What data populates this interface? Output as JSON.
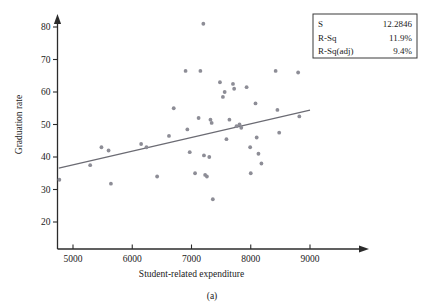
{
  "figure": {
    "caption": "(a)"
  },
  "stats_box": {
    "rows": [
      {
        "label": "S",
        "value": "12.2846"
      },
      {
        "label": "R-Sq",
        "value": "11.9%"
      },
      {
        "label": "R-Sq(adj)",
        "value": "9.4%"
      }
    ]
  },
  "chart_data": {
    "type": "scatter",
    "title": "",
    "xlabel": "Student-related expenditure",
    "ylabel": "Graduation rate",
    "xlim": [
      4700,
      9250
    ],
    "ylim": [
      17,
      84
    ],
    "xticks": [
      5000,
      6000,
      7000,
      8000,
      9000
    ],
    "yticks": [
      20,
      30,
      40,
      50,
      60,
      70,
      80
    ],
    "grid": false,
    "legend": null,
    "marker_color": "#8d8d96",
    "fit_line_color": "#6b6b73",
    "fit_line": {
      "x": [
        4760,
        9000
      ],
      "y": [
        36.6,
        54.4
      ]
    },
    "points": [
      {
        "x": 4770,
        "y": 33.0
      },
      {
        "x": 5290,
        "y": 37.5
      },
      {
        "x": 5480,
        "y": 43.0
      },
      {
        "x": 5600,
        "y": 42.0
      },
      {
        "x": 5640,
        "y": 31.8
      },
      {
        "x": 6150,
        "y": 44.0
      },
      {
        "x": 6240,
        "y": 43.0
      },
      {
        "x": 6420,
        "y": 34.0
      },
      {
        "x": 6620,
        "y": 46.5
      },
      {
        "x": 6700,
        "y": 55.0
      },
      {
        "x": 6900,
        "y": 66.5
      },
      {
        "x": 6930,
        "y": 48.5
      },
      {
        "x": 6970,
        "y": 41.5
      },
      {
        "x": 7060,
        "y": 35.0
      },
      {
        "x": 7120,
        "y": 52.0
      },
      {
        "x": 7150,
        "y": 66.5
      },
      {
        "x": 7200,
        "y": 81.0
      },
      {
        "x": 7210,
        "y": 40.5
      },
      {
        "x": 7230,
        "y": 34.5
      },
      {
        "x": 7260,
        "y": 34.0
      },
      {
        "x": 7300,
        "y": 40.0
      },
      {
        "x": 7320,
        "y": 51.5
      },
      {
        "x": 7340,
        "y": 50.5
      },
      {
        "x": 7360,
        "y": 27.0
      },
      {
        "x": 7480,
        "y": 63.0
      },
      {
        "x": 7530,
        "y": 58.5
      },
      {
        "x": 7560,
        "y": 60.0
      },
      {
        "x": 7590,
        "y": 45.5
      },
      {
        "x": 7640,
        "y": 51.5
      },
      {
        "x": 7700,
        "y": 62.5
      },
      {
        "x": 7720,
        "y": 61.0
      },
      {
        "x": 7760,
        "y": 49.5
      },
      {
        "x": 7810,
        "y": 50.0
      },
      {
        "x": 7840,
        "y": 49.0
      },
      {
        "x": 7930,
        "y": 61.5
      },
      {
        "x": 7990,
        "y": 43.0
      },
      {
        "x": 8000,
        "y": 35.0
      },
      {
        "x": 8080,
        "y": 56.5
      },
      {
        "x": 8100,
        "y": 46.0
      },
      {
        "x": 8130,
        "y": 41.0
      },
      {
        "x": 8180,
        "y": 38.0
      },
      {
        "x": 8420,
        "y": 66.5
      },
      {
        "x": 8450,
        "y": 54.5
      },
      {
        "x": 8480,
        "y": 47.5
      },
      {
        "x": 8800,
        "y": 66.0
      },
      {
        "x": 8820,
        "y": 52.5
      }
    ]
  }
}
